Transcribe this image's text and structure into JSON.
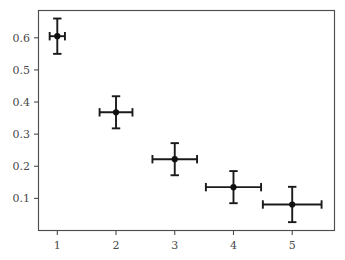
{
  "chart_data": {
    "type": "scatter",
    "title": "",
    "subtitle": "",
    "xlabel": "",
    "ylabel": "",
    "xlim": [
      0.68,
      5.72
    ],
    "ylim": [
      0.0,
      0.685
    ],
    "grid": false,
    "legend": null,
    "x": [
      1,
      2,
      3,
      4,
      5
    ],
    "y": [
      0.605,
      0.368,
      0.222,
      0.135,
      0.081
    ],
    "yerr": [
      0.055,
      0.05,
      0.05,
      0.05,
      0.055
    ],
    "xerr": [
      0.13,
      0.28,
      0.38,
      0.47,
      0.5
    ],
    "xticks": [
      1,
      2,
      3,
      4,
      5
    ],
    "xticklabels": [
      "1",
      "2",
      "3",
      "4",
      "5"
    ],
    "yticks": [
      0.1,
      0.2,
      0.3,
      0.4,
      0.5,
      0.6
    ],
    "yticklabels": [
      "0.1",
      "0.2",
      "0.3",
      "0.4",
      "0.5",
      "0.6"
    ],
    "marker_color": "#111111",
    "errorbar_color": "#1a1a1a",
    "axis_color": "#4d4d4d",
    "background_color": "#ffffff",
    "points": [
      {
        "x": 1,
        "y": 0.605,
        "xerr": 0.13,
        "yerr": 0.055
      },
      {
        "x": 2,
        "y": 0.368,
        "xerr": 0.28,
        "yerr": 0.05
      },
      {
        "x": 3,
        "y": 0.222,
        "xerr": 0.38,
        "yerr": 0.05
      },
      {
        "x": 4,
        "y": 0.135,
        "xerr": 0.47,
        "yerr": 0.05
      },
      {
        "x": 5,
        "y": 0.081,
        "xerr": 0.5,
        "yerr": 0.055
      }
    ]
  }
}
